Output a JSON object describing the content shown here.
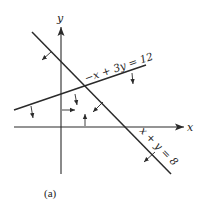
{
  "figure": {
    "caption": "(a)",
    "axes": {
      "x_label": "x",
      "y_label": "y"
    },
    "constraints": [
      {
        "equation": "−x + 3y = 12",
        "shaded_side": "below"
      },
      {
        "equation": "x + y = 8",
        "shaded_side": "below-left"
      },
      {
        "equation": "x ≥ 0",
        "shaded_side": "right"
      },
      {
        "equation": "y ≥ 0",
        "shaded_side": "above"
      }
    ],
    "colors": {
      "line": "#2a2a2a",
      "background": "#ffffff"
    }
  }
}
